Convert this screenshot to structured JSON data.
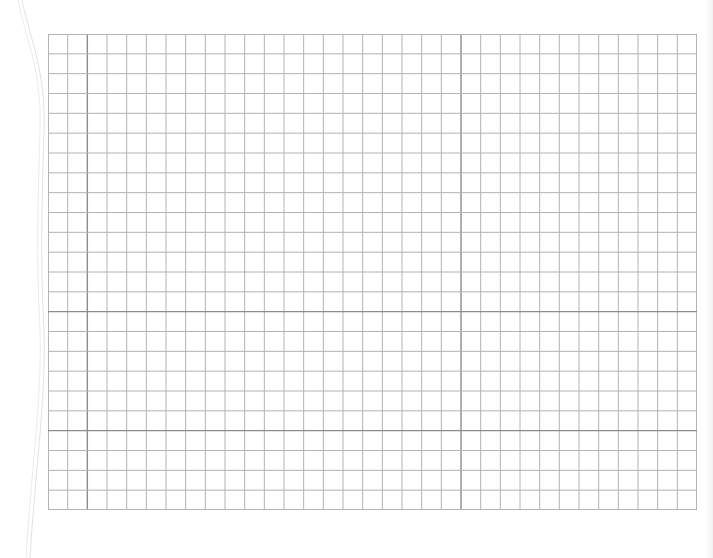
{
  "sheet": {
    "type": "graph-paper",
    "background_color": "#ffffff",
    "minor_line_color": "#b4b4b4",
    "major_line_color": "#8c8c8c",
    "edge_color": "#e2e2e2",
    "grid": {
      "left": 48,
      "top": 34,
      "width": 649,
      "height": 476,
      "columns": 33,
      "rows": 24,
      "major_columns": [
        2,
        21
      ],
      "major_rows": [
        14,
        20
      ]
    }
  }
}
